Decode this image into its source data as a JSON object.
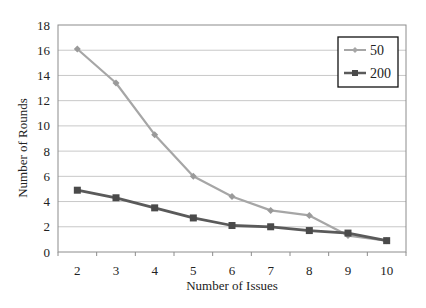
{
  "chart_data": {
    "type": "line",
    "title": "",
    "xlabel": "Number of Issues",
    "ylabel": "Number of Rounds",
    "x": [
      2,
      3,
      4,
      5,
      6,
      7,
      8,
      9,
      10
    ],
    "ylim": [
      0,
      18
    ],
    "yticks": [
      0,
      2,
      4,
      6,
      8,
      10,
      12,
      14,
      16,
      18
    ],
    "grid": true,
    "legend_position": "upper right (inside)",
    "series": [
      {
        "name": "50",
        "marker": "diamond",
        "color": "#a6a6a6",
        "values": [
          16.1,
          13.4,
          9.3,
          6.0,
          4.4,
          3.3,
          2.9,
          1.3,
          0.9
        ]
      },
      {
        "name": "200",
        "marker": "square",
        "color": "#5a5a5a",
        "values": [
          4.9,
          4.3,
          3.5,
          2.7,
          2.1,
          2.0,
          1.7,
          1.5,
          0.9
        ]
      }
    ]
  },
  "colors": {
    "grid": "#c8c8c8",
    "axis": "#7f7f7f",
    "legend_border": "#111111"
  }
}
